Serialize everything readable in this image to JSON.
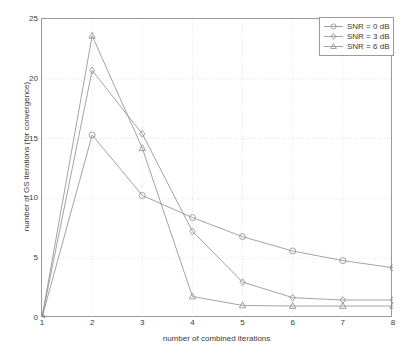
{
  "chart_data": {
    "type": "line",
    "title": "",
    "xlabel": "number of combined iterations",
    "ylabel": "number of GS iterations (for convergence)",
    "x": [
      1,
      2,
      3,
      4,
      5,
      6,
      7,
      8
    ],
    "xlim": [
      1,
      8
    ],
    "ylim": [
      0,
      25
    ],
    "xticks": [
      "1",
      "2",
      "3",
      "4",
      "5",
      "6",
      "7",
      "8"
    ],
    "yticks": [
      "0",
      "5",
      "10",
      "15",
      "20",
      "25"
    ],
    "grid": true,
    "legend_position": "top-right",
    "series": [
      {
        "name": "SNR = 0 dB",
        "marker": "circle",
        "color": "#8c8c8c",
        "values": [
          0.05,
          15.3,
          10.25,
          8.4,
          6.8,
          5.6,
          4.8,
          4.2
        ]
      },
      {
        "name": "SNR = 3 dB",
        "marker": "diamond",
        "color": "#8c8c8c",
        "values": [
          0.05,
          20.7,
          15.4,
          7.25,
          3.0,
          1.7,
          1.5,
          1.5
        ]
      },
      {
        "name": "SNR = 6 dB",
        "marker": "triangle",
        "color": "#8c8c8c",
        "values": [
          0.05,
          23.6,
          14.2,
          1.8,
          1.05,
          1.0,
          1.0,
          1.0
        ]
      }
    ]
  },
  "axes": {
    "line_color": "#9a9a9a",
    "grid_color": "#d8d8d8"
  },
  "legend": {
    "entries": [
      {
        "label": "SNR = 0 dB",
        "marker": "circle-marker"
      },
      {
        "label": "SNR = 3 dB",
        "marker": "diamond-marker"
      },
      {
        "label": "SNR = 6 dB",
        "marker": "triangle-marker"
      }
    ]
  },
  "caption": {
    "cut_off_text": ""
  }
}
